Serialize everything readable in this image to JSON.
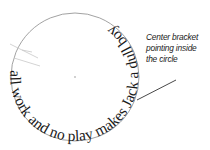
{
  "diagram": {
    "circle_text": "all work and no play makes Jack a dull boy",
    "annotation": {
      "lines": [
        "Center bracket",
        "pointing inside",
        "the circle"
      ]
    },
    "colors": {
      "circle_stroke": "#8a8a8a",
      "bracket_stroke": "#c8c8c8",
      "text": "#1a1a1a",
      "leader_line": "#333333"
    }
  }
}
